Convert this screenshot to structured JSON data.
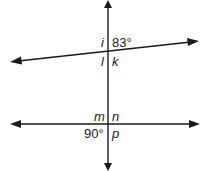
{
  "diagram": {
    "type": "geometry-lines-angles",
    "upper_intersection": {
      "labels": {
        "top_left": "i",
        "top_right": "83°",
        "bottom_left": "l",
        "bottom_right": "k"
      }
    },
    "lower_intersection": {
      "labels": {
        "top_left": "m",
        "top_right": "n",
        "bottom_left": "90°",
        "bottom_right": "p"
      }
    },
    "colors": {
      "line": "#1a1a1a",
      "background": "#ffffff"
    }
  }
}
